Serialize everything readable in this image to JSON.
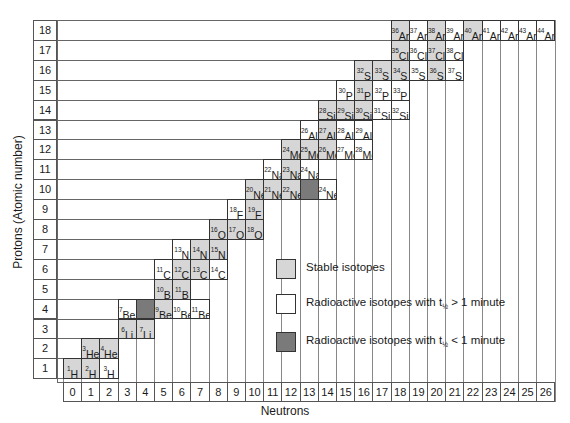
{
  "chart_data": {
    "type": "table",
    "xlabel": "Neutrons",
    "ylabel": "Protons (Atomic number)",
    "x_ticks": [
      0,
      1,
      2,
      3,
      4,
      5,
      6,
      7,
      8,
      9,
      10,
      11,
      12,
      13,
      14,
      15,
      16,
      17,
      18,
      19,
      20,
      21,
      22,
      23,
      24,
      25,
      26
    ],
    "y_ticks": [
      1,
      2,
      3,
      4,
      5,
      6,
      7,
      8,
      9,
      10,
      11,
      12,
      13,
      14,
      15,
      16,
      17,
      18
    ],
    "colors": {
      "stable": "#d6d6d6",
      "long": "#ffffff",
      "short": "#7a7a7a"
    },
    "legend": [
      {
        "key": "stable",
        "label": "Stable isotopes"
      },
      {
        "key": "long",
        "label": "Radioactive isotopes with t",
        "sub": "½",
        "suffix": " > 1 minute"
      },
      {
        "key": "short",
        "label": "Radioactive isotopes with t",
        "sub": "½",
        "suffix": " < 1 minute"
      }
    ],
    "isotopes": [
      {
        "A": 1,
        "sym": "H",
        "Z": 1,
        "N": 0,
        "s": "stable"
      },
      {
        "A": 2,
        "sym": "H",
        "Z": 1,
        "N": 1,
        "s": "stable"
      },
      {
        "A": 3,
        "sym": "H",
        "Z": 1,
        "N": 2,
        "s": "long"
      },
      {
        "A": 3,
        "sym": "He",
        "Z": 2,
        "N": 1,
        "s": "stable"
      },
      {
        "A": 4,
        "sym": "He",
        "Z": 2,
        "N": 2,
        "s": "stable"
      },
      {
        "A": 6,
        "sym": "Li",
        "Z": 3,
        "N": 3,
        "s": "stable"
      },
      {
        "A": 7,
        "sym": "Li",
        "Z": 3,
        "N": 4,
        "s": "stable"
      },
      {
        "A": 7,
        "sym": "Be",
        "Z": 4,
        "N": 3,
        "s": "long"
      },
      {
        "A": 8,
        "sym": "",
        "Z": 4,
        "N": 4,
        "s": "short"
      },
      {
        "A": 9,
        "sym": "Be",
        "Z": 4,
        "N": 5,
        "s": "stable"
      },
      {
        "A": 10,
        "sym": "Be",
        "Z": 4,
        "N": 6,
        "s": "long"
      },
      {
        "A": 11,
        "sym": "Be",
        "Z": 4,
        "N": 7,
        "s": "long"
      },
      {
        "A": 10,
        "sym": "B",
        "Z": 5,
        "N": 5,
        "s": "stable"
      },
      {
        "A": 11,
        "sym": "B",
        "Z": 5,
        "N": 6,
        "s": "stable"
      },
      {
        "A": 11,
        "sym": "C",
        "Z": 6,
        "N": 5,
        "s": "long"
      },
      {
        "A": 12,
        "sym": "C",
        "Z": 6,
        "N": 6,
        "s": "stable"
      },
      {
        "A": 13,
        "sym": "C",
        "Z": 6,
        "N": 7,
        "s": "stable"
      },
      {
        "A": 14,
        "sym": "C",
        "Z": 6,
        "N": 8,
        "s": "long"
      },
      {
        "A": 13,
        "sym": "N",
        "Z": 7,
        "N": 6,
        "s": "long"
      },
      {
        "A": 14,
        "sym": "N",
        "Z": 7,
        "N": 7,
        "s": "stable"
      },
      {
        "A": 15,
        "sym": "N",
        "Z": 7,
        "N": 8,
        "s": "stable"
      },
      {
        "A": 16,
        "sym": "O",
        "Z": 8,
        "N": 8,
        "s": "stable"
      },
      {
        "A": 17,
        "sym": "O",
        "Z": 8,
        "N": 9,
        "s": "stable"
      },
      {
        "A": 18,
        "sym": "O",
        "Z": 8,
        "N": 10,
        "s": "stable"
      },
      {
        "A": 18,
        "sym": "F",
        "Z": 9,
        "N": 9,
        "s": "long"
      },
      {
        "A": 19,
        "sym": "F",
        "Z": 9,
        "N": 10,
        "s": "stable"
      },
      {
        "A": 20,
        "sym": "Ne",
        "Z": 10,
        "N": 10,
        "s": "stable"
      },
      {
        "A": 21,
        "sym": "Ne",
        "Z": 10,
        "N": 11,
        "s": "stable"
      },
      {
        "A": 22,
        "sym": "Ne",
        "Z": 10,
        "N": 12,
        "s": "stable"
      },
      {
        "A": 23,
        "sym": "",
        "Z": 10,
        "N": 13,
        "s": "short"
      },
      {
        "A": 24,
        "sym": "Ne",
        "Z": 10,
        "N": 14,
        "s": "long"
      },
      {
        "A": 22,
        "sym": "Na",
        "Z": 11,
        "N": 11,
        "s": "long"
      },
      {
        "A": 23,
        "sym": "Na",
        "Z": 11,
        "N": 12,
        "s": "stable"
      },
      {
        "A": 24,
        "sym": "Na",
        "Z": 11,
        "N": 13,
        "s": "long"
      },
      {
        "A": 24,
        "sym": "Mg",
        "Z": 12,
        "N": 12,
        "s": "stable"
      },
      {
        "A": 25,
        "sym": "Mg",
        "Z": 12,
        "N": 13,
        "s": "stable"
      },
      {
        "A": 26,
        "sym": "Mg",
        "Z": 12,
        "N": 14,
        "s": "stable"
      },
      {
        "A": 27,
        "sym": "Mg",
        "Z": 12,
        "N": 15,
        "s": "long"
      },
      {
        "A": 28,
        "sym": "Mg",
        "Z": 12,
        "N": 16,
        "s": "long"
      },
      {
        "A": 26,
        "sym": "Al",
        "Z": 13,
        "N": 13,
        "s": "long"
      },
      {
        "A": 27,
        "sym": "Al",
        "Z": 13,
        "N": 14,
        "s": "stable"
      },
      {
        "A": 28,
        "sym": "Al",
        "Z": 13,
        "N": 15,
        "s": "long"
      },
      {
        "A": 29,
        "sym": "Al",
        "Z": 13,
        "N": 16,
        "s": "long"
      },
      {
        "A": 28,
        "sym": "Si",
        "Z": 14,
        "N": 14,
        "s": "stable"
      },
      {
        "A": 29,
        "sym": "Si",
        "Z": 14,
        "N": 15,
        "s": "stable"
      },
      {
        "A": 30,
        "sym": "Si",
        "Z": 14,
        "N": 16,
        "s": "stable"
      },
      {
        "A": 31,
        "sym": "Si",
        "Z": 14,
        "N": 17,
        "s": "long"
      },
      {
        "A": 32,
        "sym": "Si",
        "Z": 14,
        "N": 18,
        "s": "long"
      },
      {
        "A": 30,
        "sym": "P",
        "Z": 15,
        "N": 15,
        "s": "long"
      },
      {
        "A": 31,
        "sym": "P",
        "Z": 15,
        "N": 16,
        "s": "stable"
      },
      {
        "A": 32,
        "sym": "P",
        "Z": 15,
        "N": 17,
        "s": "long"
      },
      {
        "A": 33,
        "sym": "P",
        "Z": 15,
        "N": 18,
        "s": "long"
      },
      {
        "A": 32,
        "sym": "S",
        "Z": 16,
        "N": 16,
        "s": "stable"
      },
      {
        "A": 33,
        "sym": "S",
        "Z": 16,
        "N": 17,
        "s": "stable"
      },
      {
        "A": 34,
        "sym": "S",
        "Z": 16,
        "N": 18,
        "s": "stable"
      },
      {
        "A": 35,
        "sym": "S",
        "Z": 16,
        "N": 19,
        "s": "long"
      },
      {
        "A": 36,
        "sym": "S",
        "Z": 16,
        "N": 20,
        "s": "stable"
      },
      {
        "A": 37,
        "sym": "S",
        "Z": 16,
        "N": 21,
        "s": "long"
      },
      {
        "A": 35,
        "sym": "Cl",
        "Z": 17,
        "N": 18,
        "s": "stable"
      },
      {
        "A": 36,
        "sym": "Cl",
        "Z": 17,
        "N": 19,
        "s": "long"
      },
      {
        "A": 37,
        "sym": "Cl",
        "Z": 17,
        "N": 20,
        "s": "stable"
      },
      {
        "A": 38,
        "sym": "Cl",
        "Z": 17,
        "N": 21,
        "s": "long"
      },
      {
        "A": 36,
        "sym": "Ar",
        "Z": 18,
        "N": 18,
        "s": "stable"
      },
      {
        "A": 37,
        "sym": "Ar",
        "Z": 18,
        "N": 19,
        "s": "long"
      },
      {
        "A": 38,
        "sym": "Ar",
        "Z": 18,
        "N": 20,
        "s": "stable"
      },
      {
        "A": 39,
        "sym": "Ar",
        "Z": 18,
        "N": 21,
        "s": "long"
      },
      {
        "A": 40,
        "sym": "Ar",
        "Z": 18,
        "N": 22,
        "s": "stable"
      },
      {
        "A": 41,
        "sym": "Ar",
        "Z": 18,
        "N": 23,
        "s": "long"
      },
      {
        "A": 42,
        "sym": "Ar",
        "Z": 18,
        "N": 24,
        "s": "long"
      },
      {
        "A": 43,
        "sym": "Ar",
        "Z": 18,
        "N": 25,
        "s": "long"
      },
      {
        "A": 44,
        "sym": "Ar",
        "Z": 18,
        "N": 26,
        "s": "long"
      }
    ]
  },
  "axes": {
    "xlabel": "Neutrons",
    "ylabel": "Protons (Atomic number)"
  }
}
